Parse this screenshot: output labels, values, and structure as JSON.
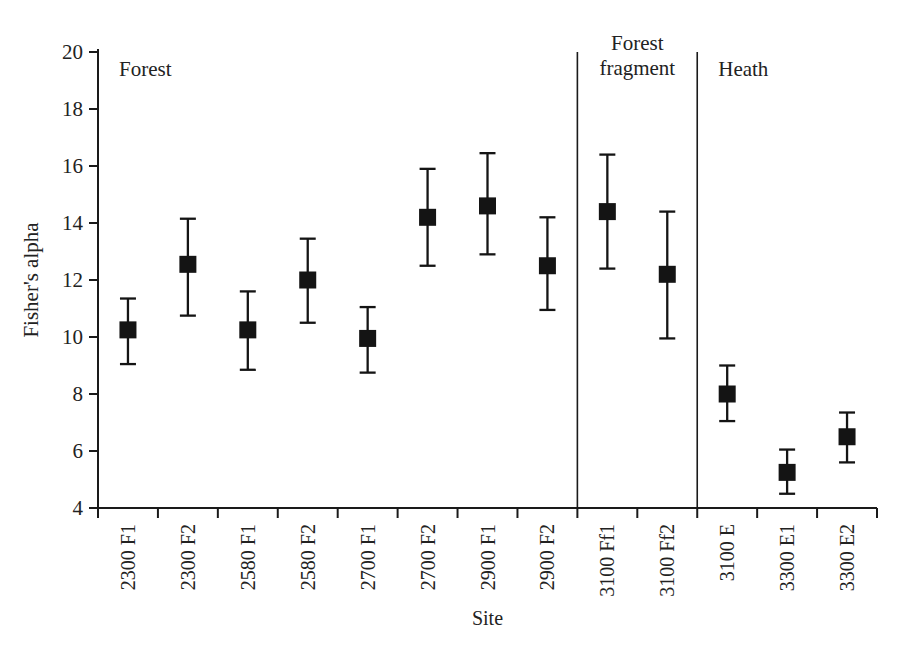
{
  "figure": {
    "background": "#ffffff",
    "ink_color": "#222222",
    "marker_color": "#141414",
    "axis_color": "#1a1a1a"
  },
  "chart_data": {
    "type": "scatter",
    "subtype": "point-with-error-bars",
    "title": "",
    "xlabel": "Site",
    "ylabel": "Fisher's alpha",
    "ylim": [
      4,
      20
    ],
    "yticks": [
      4,
      6,
      8,
      10,
      12,
      14,
      16,
      18,
      20
    ],
    "grid": false,
    "legend": "none",
    "marker": "filled-square",
    "categories": [
      "2300 F1",
      "2300 F2",
      "2580 F1",
      "2580 F2",
      "2700 F1",
      "2700 F2",
      "2900 F1",
      "2900 F2",
      "3100 Ff1",
      "3100 Ff2",
      "3100 E",
      "3300 E1",
      "3300 E2"
    ],
    "groups": [
      {
        "name": "Forest",
        "label_lines": [
          "Forest"
        ],
        "count": 8,
        "align": "left"
      },
      {
        "name": "Forest fragment",
        "label_lines": [
          "Forest",
          "fragment"
        ],
        "count": 2,
        "align": "center"
      },
      {
        "name": "Heath",
        "label_lines": [
          "Heath"
        ],
        "count": 3,
        "align": "left"
      }
    ],
    "points": [
      {
        "site": "2300 F1",
        "value": 10.25,
        "upper": 11.35,
        "lower": 9.05
      },
      {
        "site": "2300 F2",
        "value": 12.55,
        "upper": 14.15,
        "lower": 10.75
      },
      {
        "site": "2580 F1",
        "value": 10.25,
        "upper": 11.6,
        "lower": 8.85
      },
      {
        "site": "2580 F2",
        "value": 12.0,
        "upper": 13.45,
        "lower": 10.5
      },
      {
        "site": "2700 F1",
        "value": 9.95,
        "upper": 11.05,
        "lower": 8.75
      },
      {
        "site": "2700 F2",
        "value": 14.2,
        "upper": 15.9,
        "lower": 12.5
      },
      {
        "site": "2900 F1",
        "value": 14.6,
        "upper": 16.45,
        "lower": 12.9
      },
      {
        "site": "2900 F2",
        "value": 12.5,
        "upper": 14.2,
        "lower": 10.95
      },
      {
        "site": "3100 Ff1",
        "value": 14.4,
        "upper": 16.4,
        "lower": 12.4
      },
      {
        "site": "3100 Ff2",
        "value": 12.2,
        "upper": 14.4,
        "lower": 9.95
      },
      {
        "site": "3100 E",
        "value": 8.0,
        "upper": 9.0,
        "lower": 7.05
      },
      {
        "site": "3300 E1",
        "value": 5.25,
        "upper": 6.05,
        "lower": 4.5
      },
      {
        "site": "3300 E2",
        "value": 6.5,
        "upper": 7.35,
        "lower": 5.6
      }
    ]
  }
}
